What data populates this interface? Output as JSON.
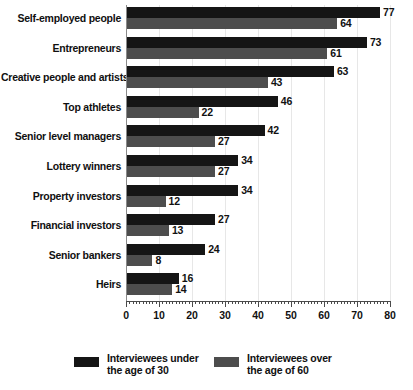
{
  "chart_data": {
    "type": "bar",
    "orientation": "horizontal",
    "title": "",
    "xlabel": "",
    "ylabel": "",
    "xlim": [
      0,
      80
    ],
    "xticks": [
      0,
      10,
      20,
      30,
      40,
      50,
      60,
      70,
      80
    ],
    "xtick_labels": [
      "0",
      "10",
      "20",
      "30",
      "40",
      "50",
      "60",
      "70",
      "80"
    ],
    "minor_tick_step": 1,
    "grid": true,
    "grid_axis": "x",
    "legend_position": "bottom",
    "categories": [
      "Self-employed people",
      "Entrepreneurs",
      "Creative people and artists",
      "Top athletes",
      "Senior level managers",
      "Lottery winners",
      "Property investors",
      "Financial investors",
      "Senior bankers",
      "Heirs"
    ],
    "series": [
      {
        "name": "Interviewees under the age of 30",
        "name_line1": "Interviewees under",
        "name_line2": "the age of 30",
        "color": "#151515",
        "values": [
          77,
          73,
          63,
          46,
          42,
          34,
          34,
          27,
          24,
          16
        ]
      },
      {
        "name": "Interviewees over the age of 60",
        "name_line1": "Interviewees over",
        "name_line2": "the age of 60",
        "color": "#4d4d4d",
        "values": [
          64,
          61,
          43,
          22,
          27,
          27,
          12,
          13,
          8,
          14
        ]
      }
    ]
  }
}
